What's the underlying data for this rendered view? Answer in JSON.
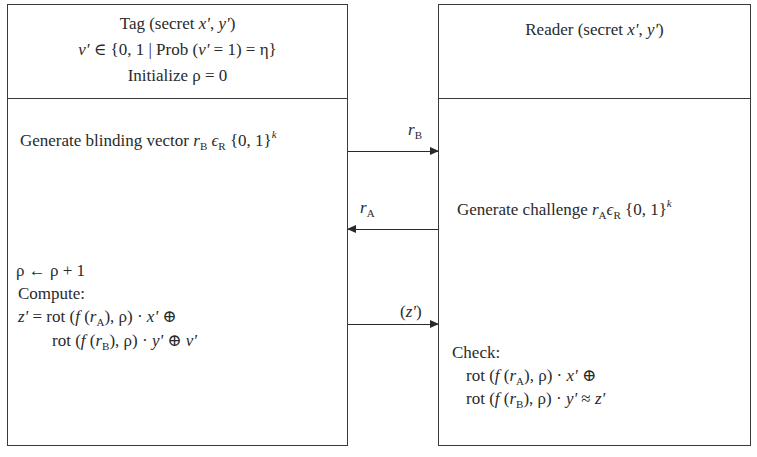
{
  "tag": {
    "header": {
      "line1_prefix": "Tag (secret ",
      "line1_x": "x'",
      "line1_sep": ", ",
      "line1_y": "y'",
      "line1_suffix": ")",
      "line2_v": "v'",
      "line2_mid": " ∈ {0, 1 | Prob (",
      "line2_v2": "v'",
      "line2_end": " = 1) = η}",
      "line3": "Initialize ρ = 0"
    },
    "step1": {
      "prefix": "Generate blinding vector ",
      "r": "r",
      "r_sub": "B",
      "eps": " ϵ",
      "eps_sub": "R",
      "set": " {0, 1}",
      "sup": "k"
    },
    "step3": {
      "line1": "ρ ← ρ + 1",
      "line2": "Compute:",
      "line3_z": "z'",
      "line3_a": " = rot (",
      "line3_f": "f",
      "line3_b": " (",
      "line3_r": "r",
      "line3_rsub": "A",
      "line3_c": "), ρ) · ",
      "line3_x": "x'",
      "line3_d": " ⊕",
      "line4_a": "rot (",
      "line4_f": "f",
      "line4_b": " (",
      "line4_r": "r",
      "line4_rsub": "B",
      "line4_c": "), ρ) · ",
      "line4_y": "y'",
      "line4_d": " ⊕ ",
      "line4_v": "v'"
    }
  },
  "reader": {
    "header": {
      "prefix": "Reader (secret ",
      "x": "x'",
      "sep": ", ",
      "y": "y'",
      "suffix": ")"
    },
    "step2": {
      "prefix": "Generate challenge ",
      "r": "r",
      "r_sub": "A",
      "eps": "ϵ",
      "eps_sub": "R",
      "set": " {0, 1}",
      "sup": "k"
    },
    "check": {
      "label": "Check:",
      "line1_a": "rot (",
      "line1_f": "f",
      "line1_b": " (",
      "line1_r": "r",
      "line1_rsub": "A",
      "line1_c": "), ρ) · ",
      "line1_x": "x'",
      "line1_d": " ⊕",
      "line2_a": "rot (",
      "line2_f": "f",
      "line2_b": " (",
      "line2_r": "r",
      "line2_rsub": "B",
      "line2_c": "), ρ) · ",
      "line2_y": "y'",
      "line2_d": " ≈ ",
      "line2_z": "z'"
    }
  },
  "messages": [
    {
      "label": "r",
      "sub": "B",
      "direction": "tag-to-reader"
    },
    {
      "label": "r",
      "sub": "A",
      "direction": "reader-to-tag"
    },
    {
      "open": "(",
      "label": "z'",
      "close": ")",
      "direction": "tag-to-reader"
    }
  ]
}
